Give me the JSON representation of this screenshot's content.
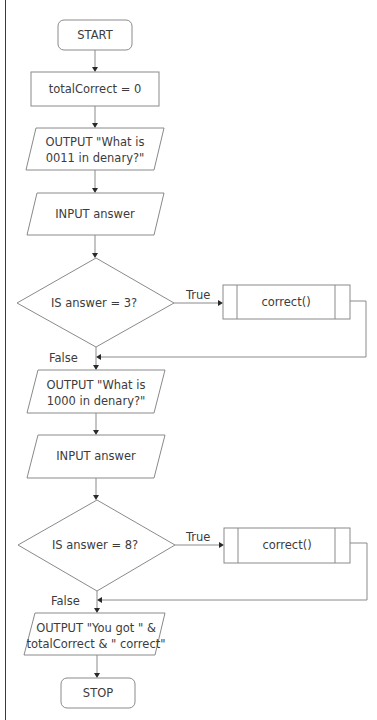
{
  "flowchart": {
    "start": {
      "label": "START"
    },
    "init": {
      "label": "totalCorrect = 0"
    },
    "output1": {
      "line1": "OUTPUT \"What is",
      "line2": "0011 in denary?\""
    },
    "input1": {
      "label": "INPUT answer"
    },
    "decision1": {
      "label": "IS answer = 3?",
      "true_label": "True",
      "false_label": "False"
    },
    "sub1": {
      "label": "correct()"
    },
    "output2": {
      "line1": "OUTPUT \"What is",
      "line2": "1000 in denary?\""
    },
    "input2": {
      "label": "INPUT answer"
    },
    "decision2": {
      "label": "IS answer = 8?",
      "true_label": "True",
      "false_label": "False"
    },
    "sub2": {
      "label": "correct()"
    },
    "output3": {
      "line1": "OUTPUT \"You got \" &",
      "line2": "totalCorrect & \" correct\""
    },
    "stop": {
      "label": "STOP"
    }
  },
  "colors": {
    "shape_stroke": "#8a8a8a",
    "text": "#3c3c3c",
    "arrowhead": "#2a2a2a",
    "background": "#ffffff"
  }
}
